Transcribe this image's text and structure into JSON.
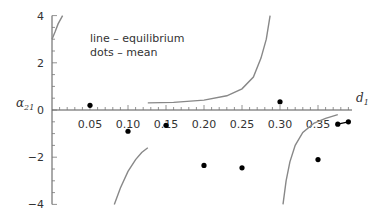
{
  "chart_data": {
    "type": "line",
    "title": "",
    "xlabel": "d1",
    "ylabel": "α21",
    "xlim": [
      0,
      0.395
    ],
    "ylim": [
      -4,
      4
    ],
    "grid": false,
    "x_ticks": [
      0.05,
      0.1,
      0.15,
      0.2,
      0.25,
      0.3,
      0.35
    ],
    "x_tick_labels": [
      "0.05",
      "0.10",
      "0.15",
      "0.20",
      "0.25",
      "0.30",
      "0.35"
    ],
    "y_ticks": [
      -4,
      -2,
      0,
      2,
      4
    ],
    "y_tick_labels": [
      "−4",
      "−2",
      "0",
      "2",
      "4"
    ],
    "legend": {
      "position": "upper-left",
      "entries": [
        "line – equilibrium",
        "dots – mean"
      ]
    },
    "series": [
      {
        "name": "equilibrium",
        "style": "line",
        "color": "#888888",
        "segments": [
          [
            [
              0.0,
              3.0
            ],
            [
              0.004,
              3.3
            ],
            [
              0.008,
              3.65
            ],
            [
              0.014,
              4.0
            ]
          ],
          [
            [
              0.082,
              -4.0
            ],
            [
              0.09,
              -3.3
            ],
            [
              0.1,
              -2.6
            ],
            [
              0.11,
              -2.1
            ],
            [
              0.118,
              -1.8
            ],
            [
              0.126,
              -1.6
            ]
          ],
          [
            [
              0.126,
              0.3
            ],
            [
              0.16,
              0.32
            ],
            [
              0.2,
              0.42
            ],
            [
              0.23,
              0.6
            ],
            [
              0.25,
              0.9
            ],
            [
              0.265,
              1.4
            ],
            [
              0.275,
              2.2
            ],
            [
              0.282,
              3.0
            ],
            [
              0.287,
              4.0
            ]
          ],
          [
            [
              0.304,
              -4.0
            ],
            [
              0.308,
              -3.0
            ],
            [
              0.313,
              -2.2
            ],
            [
              0.32,
              -1.5
            ],
            [
              0.33,
              -0.95
            ],
            [
              0.345,
              -0.55
            ],
            [
              0.36,
              -0.35
            ],
            [
              0.376,
              -0.2
            ]
          ]
        ]
      },
      {
        "name": "mean",
        "style": "dots",
        "color": "#000000",
        "points": [
          [
            0.05,
            0.2
          ],
          [
            0.1,
            -0.9
          ],
          [
            0.15,
            -0.65
          ],
          [
            0.2,
            -2.35
          ],
          [
            0.25,
            -2.45
          ],
          [
            0.3,
            0.35
          ],
          [
            0.35,
            -2.1
          ],
          [
            0.376,
            -0.6
          ],
          [
            0.39,
            -0.5
          ]
        ]
      }
    ]
  }
}
